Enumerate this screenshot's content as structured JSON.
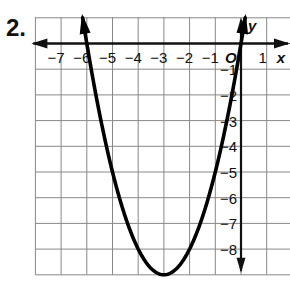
{
  "problem": {
    "number": "2."
  },
  "chart_data": {
    "type": "line",
    "title": "",
    "xlabel": "x",
    "ylabel": "y",
    "origin_label": "O",
    "xlim": [
      -8,
      2
    ],
    "ylim": [
      -9,
      1
    ],
    "grid": true,
    "x_tick_labels": [
      "−7",
      "−6",
      "−5",
      "−4",
      "−3",
      "−2",
      "−1",
      "1"
    ],
    "x_ticks": [
      -7,
      -6,
      -5,
      -4,
      -3,
      -2,
      -1,
      1
    ],
    "y_tick_labels": [
      "−1",
      "−2",
      "−3",
      "−4",
      "−5",
      "−6",
      "−7",
      "−8"
    ],
    "y_ticks": [
      -1,
      -2,
      -3,
      -4,
      -5,
      -6,
      -7,
      -8
    ],
    "series": [
      {
        "name": "parabola",
        "equation": "y = x^2 + 6x",
        "vertex": [
          -3,
          -9
        ],
        "x_intercepts": [
          -6,
          0
        ],
        "x": [
          -6.3,
          -6,
          -5,
          -4,
          -3,
          -2,
          -1,
          0,
          0.3
        ],
        "y": [
          1.0,
          0,
          -5,
          -8,
          -9,
          -8,
          -5,
          0,
          1.0
        ],
        "arrows_at_ends": true
      }
    ]
  },
  "colors": {
    "curve": "#000000",
    "axis": "#111111",
    "grid": "#888888",
    "background": "#ffffff"
  }
}
